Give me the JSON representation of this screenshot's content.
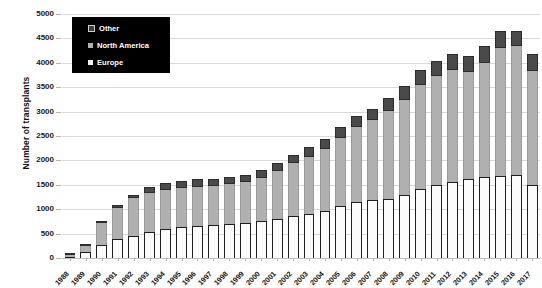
{
  "chart_data": {
    "type": "bar",
    "stacked": true,
    "title": "",
    "xlabel": "",
    "ylabel": "Number of transplants",
    "ylim": [
      0,
      5000
    ],
    "ytick_step": 500,
    "yticks": [
      0,
      500,
      1000,
      1500,
      2000,
      2500,
      3000,
      3500,
      4000,
      4500,
      5000
    ],
    "grid": "horizontal",
    "legend_position": "top-left",
    "legend_style": {
      "background": "#000000",
      "text_color": "#ffffff"
    },
    "categories": [
      "1988",
      "1989",
      "1990",
      "1991",
      "1992",
      "1993",
      "1994",
      "1995",
      "1996",
      "1997",
      "1998",
      "1999",
      "2000",
      "2001",
      "2002",
      "2003",
      "2004",
      "2005",
      "2006",
      "2007",
      "2008",
      "2009",
      "2010",
      "2011",
      "2012",
      "2013",
      "2014",
      "2015",
      "2016",
      "2017"
    ],
    "series": [
      {
        "name": "Europe",
        "color": "#fbfbfb",
        "values": [
          30,
          120,
          260,
          380,
          460,
          540,
          600,
          640,
          660,
          680,
          700,
          720,
          760,
          800,
          860,
          900,
          960,
          1060,
          1150,
          1180,
          1210,
          1300,
          1420,
          1490,
          1560,
          1620,
          1660,
          1690,
          1700,
          1490
        ]
      },
      {
        "name": "North America",
        "color": "#b0b0b0",
        "values": [
          30,
          130,
          450,
          640,
          760,
          800,
          800,
          790,
          800,
          790,
          810,
          830,
          880,
          980,
          1080,
          1180,
          1280,
          1400,
          1530,
          1640,
          1800,
          1940,
          2130,
          2230,
          2290,
          2200,
          2340,
          2620,
          2640,
          2350
        ]
      },
      {
        "name": "Other",
        "color": "#4a4a4a",
        "values": [
          0,
          10,
          40,
          60,
          80,
          110,
          130,
          140,
          150,
          150,
          150,
          150,
          160,
          170,
          180,
          190,
          200,
          230,
          240,
          240,
          260,
          280,
          300,
          320,
          330,
          330,
          340,
          350,
          310,
          340
        ]
      }
    ],
    "totals": [
      60,
      260,
      750,
      1080,
      1300,
      1450,
      1530,
      1570,
      1610,
      1620,
      1660,
      1700,
      1800,
      1950,
      2120,
      2270,
      2440,
      2690,
      2920,
      3060,
      3270,
      3520,
      3850,
      4040,
      4180,
      4150,
      4340,
      4660,
      4650,
      4180
    ]
  },
  "legend": {
    "items": [
      {
        "label": "Other",
        "key": "k-other"
      },
      {
        "label": "North America",
        "key": "k-na"
      },
      {
        "label": "Europe",
        "key": "k-eu"
      }
    ]
  }
}
